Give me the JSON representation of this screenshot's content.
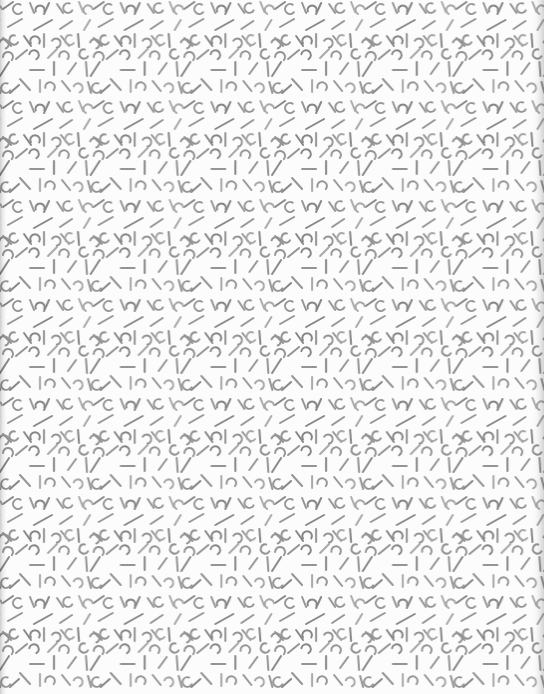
{
  "canvas": {
    "width": 544,
    "height": 694,
    "background_color": "#fcfcfc",
    "description": "Seamless decorative confetti texture of short gray dashes and small arcs on near-white paper"
  },
  "pattern": {
    "name": "memphis-confetti-texture",
    "tile_width": 90.7,
    "tile_height": 99.0,
    "tile_columns": 6,
    "tile_rows": 7,
    "stroke_color": "#949496",
    "stroke_color_light": "#a8a8aa",
    "stroke_color_dark": "#86868a",
    "stroke_width": 2.0,
    "line_cap": "round",
    "marks": {
      "dashes": [
        {
          "x1": 3,
          "y1": 9,
          "x2": 13,
          "y2": 2,
          "tone": "dark"
        },
        {
          "x1": 30,
          "y1": 3,
          "x2": 34,
          "y2": 13,
          "tone": "base"
        },
        {
          "x1": 44,
          "y1": 14,
          "x2": 49,
          "y2": 3,
          "tone": "dark"
        },
        {
          "x1": 57,
          "y1": 4,
          "x2": 63,
          "y2": 13,
          "tone": "base"
        },
        {
          "x1": 79,
          "y1": 2,
          "x2": 83,
          "y2": 12,
          "tone": "light"
        },
        {
          "x1": 8,
          "y1": 27,
          "x2": 22,
          "y2": 19,
          "tone": "base"
        },
        {
          "x1": 34,
          "y1": 30,
          "x2": 52,
          "y2": 20,
          "tone": "dark"
        },
        {
          "x1": 60,
          "y1": 29,
          "x2": 72,
          "y2": 21,
          "tone": "base"
        },
        {
          "x1": 84,
          "y1": 30,
          "x2": 90,
          "y2": 20,
          "tone": "light"
        },
        {
          "x1": 3,
          "y1": 38,
          "x2": 11,
          "y2": 46,
          "tone": "base"
        },
        {
          "x1": 24,
          "y1": 36,
          "x2": 31,
          "y2": 46,
          "tone": "dark"
        },
        {
          "x1": 44,
          "y1": 34,
          "x2": 44,
          "y2": 47,
          "tone": "base"
        },
        {
          "x1": 61,
          "y1": 36,
          "x2": 69,
          "y2": 46,
          "tone": "base"
        },
        {
          "x1": 78,
          "y1": 34,
          "x2": 79,
          "y2": 47,
          "tone": "dark"
        },
        {
          "x1": 16,
          "y1": 59,
          "x2": 27,
          "y2": 50,
          "tone": "base"
        },
        {
          "x1": 48,
          "y1": 58,
          "x2": 57,
          "y2": 49,
          "tone": "light"
        },
        {
          "x1": 0,
          "y1": 76,
          "x2": 9,
          "y2": 62,
          "tone": "dark"
        },
        {
          "x1": 30,
          "y1": 70,
          "x2": 44,
          "y2": 70,
          "tone": "base"
        },
        {
          "x1": 54,
          "y1": 62,
          "x2": 54,
          "y2": 75,
          "tone": "dark"
        },
        {
          "x1": 68,
          "y1": 74,
          "x2": 76,
          "y2": 63,
          "tone": "base"
        },
        {
          "x1": 86,
          "y1": 62,
          "x2": 87,
          "y2": 76,
          "tone": "base"
        },
        {
          "x1": 20,
          "y1": 79,
          "x2": 30,
          "y2": 90,
          "tone": "base"
        },
        {
          "x1": 40,
          "y1": 80,
          "x2": 40,
          "y2": 92,
          "tone": "light"
        },
        {
          "x1": 62,
          "y1": 81,
          "x2": 70,
          "y2": 91,
          "tone": "base"
        },
        {
          "x1": 88,
          "y1": 82,
          "x2": 91,
          "y2": 93,
          "tone": "base"
        },
        {
          "x1": 10,
          "y1": 93,
          "x2": 19,
          "y2": 85,
          "tone": "dark"
        }
      ],
      "arcs": [
        {
          "cx": 18,
          "cy": 9,
          "r": 5.0,
          "a0": 40,
          "a1": 300,
          "tone": "base"
        },
        {
          "cx": 40,
          "cy": 10,
          "r": 4.6,
          "a0": 160,
          "a1": 380,
          "tone": "dark"
        },
        {
          "cx": 68,
          "cy": 8,
          "r": 4.8,
          "a0": 30,
          "a1": 290,
          "tone": "base"
        },
        {
          "cx": 88,
          "cy": 10,
          "r": 4.6,
          "a0": 120,
          "a1": 350,
          "tone": "light"
        },
        {
          "cx": 4,
          "cy": 44,
          "r": 4.8,
          "a0": 200,
          "a1": 430,
          "tone": "base"
        },
        {
          "cx": 14,
          "cy": 40,
          "r": 4.6,
          "a0": 30,
          "a1": 280,
          "tone": "base"
        },
        {
          "cx": 35,
          "cy": 41,
          "r": 4.8,
          "a0": 150,
          "a1": 390,
          "tone": "dark"
        },
        {
          "cx": 56,
          "cy": 43,
          "r": 4.6,
          "a0": 210,
          "a1": 440,
          "tone": "base"
        },
        {
          "cx": 70,
          "cy": 40,
          "r": 4.8,
          "a0": 40,
          "a1": 290,
          "tone": "light"
        },
        {
          "cx": 8,
          "cy": 57,
          "r": 5.0,
          "a0": 180,
          "a1": 400,
          "tone": "base"
        },
        {
          "cx": 34,
          "cy": 55,
          "r": 4.8,
          "a0": 190,
          "a1": 420,
          "tone": "dark"
        },
        {
          "cx": 64,
          "cy": 56,
          "r": 4.8,
          "a0": 170,
          "a1": 400,
          "tone": "base"
        },
        {
          "cx": 84,
          "cy": 54,
          "r": 4.6,
          "a0": 30,
          "a1": 280,
          "tone": "base"
        },
        {
          "cx": 6,
          "cy": 88,
          "r": 4.8,
          "a0": 30,
          "a1": 290,
          "tone": "base"
        },
        {
          "cx": 50,
          "cy": 87,
          "r": 4.8,
          "a0": 170,
          "a1": 400,
          "tone": "base"
        },
        {
          "cx": 78,
          "cy": 88,
          "r": 4.6,
          "a0": 200,
          "a1": 430,
          "tone": "light"
        }
      ]
    }
  },
  "edges": {
    "left_smudge_color": "#78787a",
    "right_smudge_color": "#78787a"
  }
}
